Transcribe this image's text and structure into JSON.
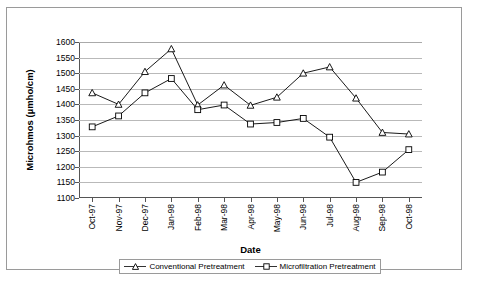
{
  "chart_data": {
    "type": "line",
    "title": "",
    "xlabel": "Date",
    "ylabel": "Microhmos (µmho/cm)",
    "categories": [
      "Oct-97",
      "Nov-97",
      "Dec-97",
      "Jan-98",
      "Feb-98",
      "Mar-98",
      "Apr-98",
      "May-98",
      "Jun-98",
      "Jul-98",
      "Aug-98",
      "Sep-98",
      "Oct-98"
    ],
    "yticks": [
      1100,
      1150,
      1200,
      1250,
      1300,
      1350,
      1400,
      1450,
      1500,
      1550,
      1600
    ],
    "ylim": [
      1100,
      1600
    ],
    "grid": true,
    "legend_position": "bottom",
    "series": [
      {
        "name": "Conventional Pretreatment",
        "marker": "triangle",
        "color": "#000000",
        "values": [
          1437,
          1400,
          1505,
          1578,
          1398,
          1462,
          1397,
          1423,
          1500,
          1520,
          1420,
          1310,
          1305
        ]
      },
      {
        "name": "Microfiltration Pretreatment",
        "marker": "square",
        "color": "#000000",
        "values": [
          1328,
          1363,
          1437,
          1483,
          1383,
          1398,
          1337,
          1342,
          1355,
          1295,
          1150,
          1183,
          1255
        ]
      }
    ]
  },
  "legend": {
    "items": [
      {
        "label": "Conventional Pretreatment",
        "marker": "triangle-marker-icon"
      },
      {
        "label": "Microfiltration Pretreatment",
        "marker": "square-marker-icon"
      }
    ]
  }
}
